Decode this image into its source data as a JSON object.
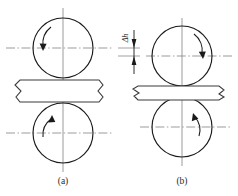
{
  "figure": {
    "background_color": "#ffffff",
    "line_color": "#1a1a1a",
    "centerline_color": "#8a8a8a",
    "workpiece_color": "#3a3a3a"
  },
  "captions": {
    "left": "(a)",
    "right": "(b)"
  },
  "dimension": {
    "label": "Δh",
    "meaning": "thickness-reduction"
  },
  "panels": [
    {
      "id": "a",
      "caption": "(a)",
      "top_roll": {
        "cx": 63,
        "cy": 48,
        "r": 30,
        "rotation_arrow": "counterclockwise",
        "arrow_side": "left"
      },
      "bottom_roll": {
        "cx": 63,
        "cy": 133,
        "r": 30,
        "rotation_arrow": "clockwise",
        "arrow_side": "left"
      },
      "workpiece": {
        "top_y": 80,
        "bottom_y": 102,
        "thickness": 22,
        "left_x": 14,
        "right_x": 103,
        "break_ends": "both"
      }
    },
    {
      "id": "b",
      "caption": "(b)",
      "top_roll": {
        "cx": 182,
        "cy": 56,
        "r": 30,
        "rotation_arrow": "clockwise",
        "arrow_side": "right"
      },
      "bottom_roll": {
        "cx": 182,
        "cy": 127,
        "r": 30,
        "rotation_arrow": "clockwise",
        "arrow_side": "right"
      },
      "workpiece": {
        "top_y": 86,
        "bottom_y": 100,
        "thickness": 14,
        "left_x": 133,
        "right_x": 224,
        "break_ends": "both"
      }
    }
  ],
  "centerlines": {
    "panel_a_top_y": 48,
    "panel_a_bottom_y": 133,
    "panel_b_top_y": 56,
    "panel_b_bottom_y": 127,
    "panel_a_vertical_x": 63,
    "panel_b_vertical_x": 182
  }
}
